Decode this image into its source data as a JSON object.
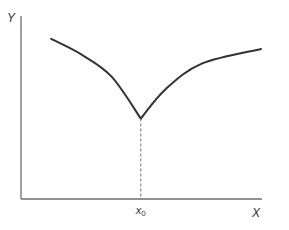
{
  "chart_data": {
    "type": "line",
    "title": "",
    "xlabel": "X",
    "ylabel": "Y",
    "xlim": [
      0,
      1
    ],
    "ylim": [
      0,
      1
    ],
    "grid": false,
    "legend": "none",
    "x_ticks": [
      {
        "x": 0.497,
        "label": "x",
        "subscript": "0"
      }
    ],
    "series": [
      {
        "name": "left-branch",
        "points": [
          [
            0.125,
            0.875
          ],
          [
            0.25,
            0.79
          ],
          [
            0.375,
            0.67
          ],
          [
            0.497,
            0.44
          ]
        ]
      },
      {
        "name": "right-branch",
        "points": [
          [
            0.497,
            0.44
          ],
          [
            0.6,
            0.6
          ],
          [
            0.75,
            0.74
          ],
          [
            0.996,
            0.82
          ]
        ]
      }
    ],
    "annotations": [
      {
        "type": "vertical-dashed-line",
        "x": 0.497,
        "from_y": 0,
        "to_y": 0.44,
        "label": "x0"
      }
    ]
  }
}
